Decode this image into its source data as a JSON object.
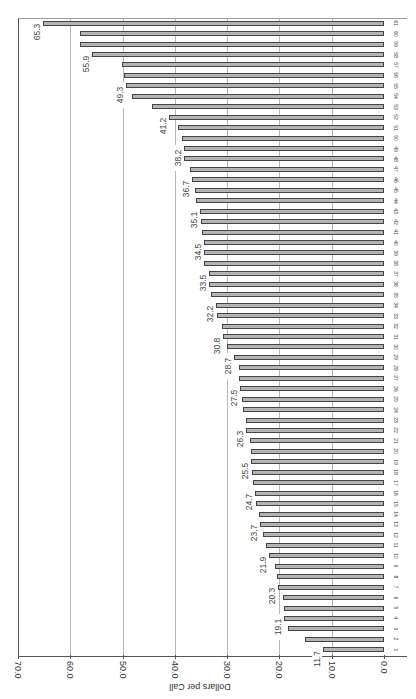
{
  "chart_data": {
    "type": "bar",
    "orientation": "rotated-90-clockwise (value axis horizontal at bottom, decreasing left-to-right; categories stacked bottom-to-top)",
    "title": "",
    "xlabel": "",
    "ylabel": "Dollars per Call",
    "ylim": [
      0,
      70
    ],
    "yticks": [
      "0.0",
      "10.0",
      "20.0",
      "30.0",
      "40.0",
      "50.0",
      "60.0",
      "70.0"
    ],
    "grid": true,
    "legend": null,
    "bar_color": "#b4b4b4",
    "bar_edge_color": "#444444",
    "categories": [
      "1",
      "2",
      "3",
      "4",
      "5",
      "6",
      "7",
      "8",
      "9",
      "10",
      "11",
      "12",
      "13",
      "14",
      "15",
      "16",
      "17",
      "18",
      "19",
      "20",
      "21",
      "22",
      "23",
      "24",
      "25",
      "26",
      "27",
      "28",
      "29",
      "30",
      "31",
      "32",
      "33",
      "34",
      "35",
      "36",
      "37",
      "38",
      "39",
      "40",
      "41",
      "42",
      "43",
      "44",
      "45",
      "46",
      "47",
      "48",
      "49",
      "50",
      "51",
      "52",
      "53",
      "54",
      "55",
      "56",
      "57",
      "58",
      "59",
      "60",
      "61"
    ],
    "values": [
      11.7,
      15.1,
      18.4,
      19.1,
      19.1,
      19.3,
      20.3,
      20.5,
      20.8,
      21.9,
      22.5,
      23.1,
      23.7,
      23.9,
      24.4,
      24.7,
      25.1,
      25.3,
      25.5,
      25.5,
      25.6,
      26.3,
      26.3,
      27.0,
      27.2,
      27.5,
      27.7,
      27.7,
      28.7,
      30.0,
      30.8,
      31.0,
      32.0,
      32.2,
      33.1,
      33.4,
      33.5,
      34.4,
      34.5,
      34.5,
      34.8,
      35.0,
      35.1,
      35.9,
      36.1,
      36.7,
      37.1,
      38.2,
      38.2,
      38.6,
      39.4,
      41.2,
      44.4,
      48.2,
      49.3,
      49.7,
      50.1,
      55.9,
      58.1,
      58.1,
      65.3
    ],
    "annotations": [
      {
        "category": "1",
        "label": "11.7"
      },
      {
        "category": "4",
        "label": "19.1"
      },
      {
        "category": "7",
        "label": "20.3"
      },
      {
        "category": "10",
        "label": "21.9"
      },
      {
        "category": "13",
        "label": "23.7"
      },
      {
        "category": "16",
        "label": "24.7"
      },
      {
        "category": "19",
        "label": "25.5"
      },
      {
        "category": "22",
        "label": "26.3"
      },
      {
        "category": "26",
        "label": "27.5"
      },
      {
        "category": "29",
        "label": "28.7"
      },
      {
        "category": "31",
        "label": "30.8"
      },
      {
        "category": "34",
        "label": "32.2"
      },
      {
        "category": "37",
        "label": "33.5"
      },
      {
        "category": "40",
        "label": "34.5"
      },
      {
        "category": "43",
        "label": "35.1"
      },
      {
        "category": "46",
        "label": "36.7"
      },
      {
        "category": "49",
        "label": "38.2"
      },
      {
        "category": "52",
        "label": "41.2"
      },
      {
        "category": "55",
        "label": "49.3"
      },
      {
        "category": "58",
        "label": "55.9"
      },
      {
        "category": "61",
        "label": "65.3"
      }
    ]
  }
}
